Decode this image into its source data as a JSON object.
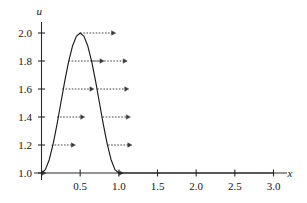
{
  "chart_data": {
    "type": "line",
    "title": "",
    "subtitle": "",
    "xlabel": "x",
    "ylabel": "u",
    "xlim": [
      0,
      3.0
    ],
    "ylim": [
      1.0,
      2.05
    ],
    "grid": false,
    "legend": null,
    "x_ticks": [
      {
        "value": 0.5,
        "label": "0.5"
      },
      {
        "value": 1.0,
        "label": "1.0"
      },
      {
        "value": 1.5,
        "label": "1.5"
      },
      {
        "value": 2.0,
        "label": "2.0"
      },
      {
        "value": 2.5,
        "label": "2.5"
      },
      {
        "value": 3.0,
        "label": "3.0"
      }
    ],
    "y_ticks": [
      {
        "value": 1.0,
        "label": "1.0"
      },
      {
        "value": 1.2,
        "label": "1.2"
      },
      {
        "value": 1.4,
        "label": "1.4"
      },
      {
        "value": 1.6,
        "label": "1.6"
      },
      {
        "value": 1.8,
        "label": "1.8"
      },
      {
        "value": 2.0,
        "label": "2.0"
      }
    ],
    "series": [
      {
        "name": "u(x)",
        "description": "Unit baseline with a smooth bump of amplitude 1.0 over 0 <= x <= 1, peak u = 2.0 at x = 0.5, then constant u = 1.0 for x > 1.",
        "points": [
          [
            0.0,
            1.0
          ],
          [
            0.05,
            1.024
          ],
          [
            0.1,
            1.095
          ],
          [
            0.15,
            1.206
          ],
          [
            0.2,
            1.345
          ],
          [
            0.25,
            1.5
          ],
          [
            0.3,
            1.655
          ],
          [
            0.35,
            1.794
          ],
          [
            0.4,
            1.905
          ],
          [
            0.45,
            1.976
          ],
          [
            0.5,
            2.0
          ],
          [
            0.55,
            1.976
          ],
          [
            0.6,
            1.905
          ],
          [
            0.65,
            1.794
          ],
          [
            0.7,
            1.655
          ],
          [
            0.75,
            1.5
          ],
          [
            0.8,
            1.345
          ],
          [
            0.85,
            1.206
          ],
          [
            0.9,
            1.095
          ],
          [
            0.95,
            1.024
          ],
          [
            1.0,
            1.0
          ],
          [
            1.5,
            1.0
          ],
          [
            2.0,
            1.0
          ],
          [
            2.5,
            1.0
          ],
          [
            3.0,
            1.0
          ]
        ]
      }
    ],
    "annotations": {
      "kind": "characteristic-velocity-arrows",
      "note": "Dashed horizontal arrows drawn at constant u levels, arrow length proportional to u (wave speed). Pairs appear on the rising and falling flanks of the bump.",
      "arrows": [
        {
          "u": 2.0,
          "x_start": 0.5,
          "x_end": 0.96,
          "flank": "peak"
        },
        {
          "u": 1.8,
          "x_start": 0.35,
          "x_end": 0.81,
          "flank": "left"
        },
        {
          "u": 1.8,
          "x_start": 0.65,
          "x_end": 1.11,
          "flank": "right"
        },
        {
          "u": 1.6,
          "x_start": 0.27,
          "x_end": 0.68,
          "flank": "left"
        },
        {
          "u": 1.6,
          "x_start": 0.72,
          "x_end": 1.13,
          "flank": "right"
        },
        {
          "u": 1.4,
          "x_start": 0.2,
          "x_end": 0.56,
          "flank": "left"
        },
        {
          "u": 1.4,
          "x_start": 0.79,
          "x_end": 1.15,
          "flank": "right"
        },
        {
          "u": 1.2,
          "x_start": 0.13,
          "x_end": 0.44,
          "flank": "left"
        },
        {
          "u": 1.2,
          "x_start": 0.86,
          "x_end": 1.17,
          "flank": "right"
        },
        {
          "u": 1.0,
          "x_start": 0.0,
          "x_end": 0.06,
          "flank": "left"
        },
        {
          "u": 1.0,
          "x_start": 1.0,
          "x_end": 1.06,
          "flank": "right"
        }
      ]
    },
    "style": {
      "curve_color": "#1a1a1a",
      "axis_color": "#2a2a2a",
      "arrow_color": "#3a3a3a",
      "background": "#ffffff"
    }
  }
}
